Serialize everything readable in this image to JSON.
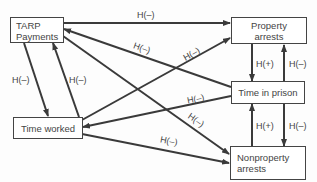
{
  "nodes": {
    "tarp": {
      "line1": "TARP",
      "line2": "Payments"
    },
    "property_arrests": {
      "label": "Property arrests"
    },
    "time_in_prison": {
      "label": "Time in prison"
    },
    "time_worked": {
      "label": "Time worked"
    },
    "nonproperty_arrests": {
      "line1": "Nonproperty",
      "line2": "arrests"
    }
  },
  "edges": [
    {
      "from": "TARP Payments",
      "to": "Property arrests",
      "label": "H(–)"
    },
    {
      "from": "Time in prison",
      "to": "TARP Payments",
      "label": "H(–)"
    },
    {
      "from": "TARP Payments",
      "to": "Nonproperty arrests",
      "label": "H(–)"
    },
    {
      "from": "TARP Payments",
      "to": "Time worked",
      "label": "H(–)"
    },
    {
      "from": "Time worked",
      "to": "TARP Payments",
      "label": "H(–)"
    },
    {
      "from": "Time worked",
      "to": "Property arrests",
      "label": "H(–)"
    },
    {
      "from": "Time in prison",
      "to": "Time worked",
      "label": "H(–)"
    },
    {
      "from": "Time worked",
      "to": "Nonproperty arrests",
      "label": "H(–)"
    },
    {
      "from": "Property arrests",
      "to": "Time in prison",
      "label": "H(+)"
    },
    {
      "from": "Time in prison",
      "to": "Property arrests",
      "label": "H(–)"
    },
    {
      "from": "Nonproperty arrests",
      "to": "Time in prison",
      "label": "H(+)"
    },
    {
      "from": "Time in prison",
      "to": "Nonproperty arrests",
      "label": "H(–)"
    }
  ],
  "colors": {
    "line": "#3a3a3a",
    "text": "#444444",
    "background": "#fdfdfd"
  }
}
